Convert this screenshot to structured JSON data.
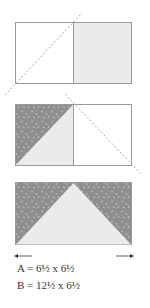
{
  "diagram": {
    "steps": [
      {
        "name": "step-1",
        "description": "White square A beside light gray rectangle, diagonal dashed line through left square"
      },
      {
        "name": "step-2",
        "description": "Left square split diagonally into patterned dark gray and light gray triangles, diagonal dashed line through right square"
      },
      {
        "name": "step-3",
        "description": "Flying geese unit: light gray center triangle with patterned dark gray corners"
      }
    ],
    "arrows": {
      "left": "left-arrow",
      "right": "right-arrow"
    },
    "colors": {
      "light_fill": "#ebebeb",
      "dark_fill": "#8f8f8f",
      "speckle": "#bdbdbd",
      "outline": "#9a9a9a",
      "dash": "#aaaaaa"
    }
  },
  "labels": {
    "a": "A = 6½ x 6½",
    "b": "B = 12½ x 6½"
  }
}
